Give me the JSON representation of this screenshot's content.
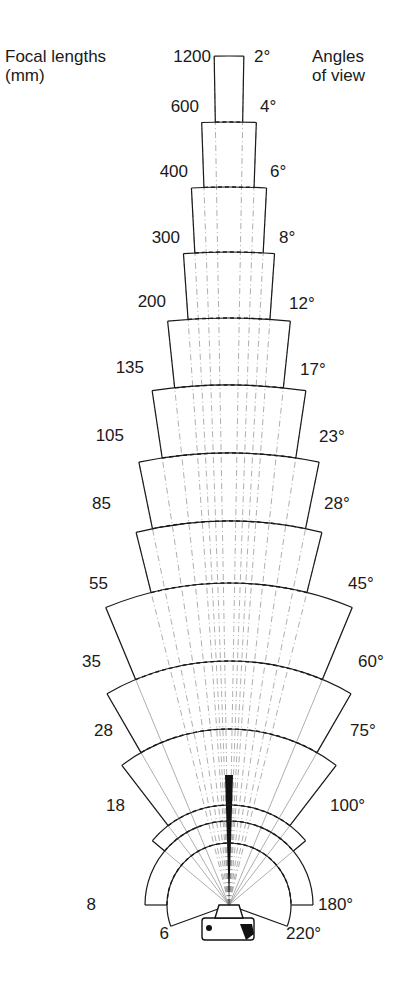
{
  "header": {
    "left_title_line1": "Focal lengths",
    "left_title_line2": "(mm)",
    "right_title_line1": "Angles",
    "right_title_line2": "of view"
  },
  "chart_data": {
    "type": "diagram",
    "left_axis_label": "Focal lengths (mm)",
    "right_axis_label": "Angles of view",
    "bands": [
      {
        "focal_mm": "1200",
        "angle": "2°",
        "angle_deg": 2,
        "top_y": 56,
        "half_w": 15
      },
      {
        "focal_mm": "600",
        "angle": "4°",
        "angle_deg": 4,
        "top_y": 122,
        "half_w": 28
      },
      {
        "focal_mm": "400",
        "angle": "6°",
        "angle_deg": 6,
        "top_y": 187,
        "half_w": 37
      },
      {
        "focal_mm": "300",
        "angle": "8°",
        "angle_deg": 8,
        "top_y": 252,
        "half_w": 46
      },
      {
        "focal_mm": "200",
        "angle": "12°",
        "angle_deg": 12,
        "top_y": 318,
        "half_w": 58
      },
      {
        "focal_mm": "135",
        "angle": "17°",
        "angle_deg": 17,
        "top_y": 385,
        "half_w": 77
      },
      {
        "focal_mm": "105",
        "angle": "23°",
        "angle_deg": 23,
        "top_y": 453,
        "half_w": 87
      },
      {
        "focal_mm": "85",
        "angle": "28°",
        "angle_deg": 28,
        "top_y": 521,
        "half_w": 91
      },
      {
        "focal_mm": "55",
        "angle": "45°",
        "angle_deg": 45,
        "top_y": 583,
        "half_w": 123
      },
      {
        "focal_mm": "35",
        "angle": "60°",
        "angle_deg": 60,
        "top_y": 661,
        "half_w": 130
      },
      {
        "focal_mm": "28",
        "angle": "75°",
        "angle_deg": 75,
        "top_y": 729,
        "half_w": 113
      },
      {
        "focal_mm": "18",
        "angle": "100°",
        "angle_deg": 100,
        "top_y": 805,
        "half_w": 97
      },
      {
        "focal_mm": "8",
        "angle": "180°",
        "angle_deg": 180,
        "top_y": 822,
        "half_w": 84
      },
      {
        "focal_mm": "6",
        "angle": "220°",
        "angle_deg": 220,
        "top_y": 845,
        "half_w": 60
      }
    ],
    "origin": {
      "x": 229,
      "y": 905
    },
    "labels": [
      {
        "focal": "1200",
        "fx": 211,
        "fy": 48,
        "angle": "2°",
        "ax": 254,
        "ay": 48
      },
      {
        "focal": "600",
        "fx": 199,
        "fy": 98,
        "angle": "4°",
        "ax": 260,
        "ay": 98
      },
      {
        "focal": "400",
        "fx": 188,
        "fy": 163,
        "angle": "6°",
        "ax": 270,
        "ay": 163
      },
      {
        "focal": "300",
        "fx": 180,
        "fy": 229,
        "angle": "8°",
        "ax": 279,
        "ay": 229
      },
      {
        "focal": "200",
        "fx": 166,
        "fy": 293,
        "angle": "12°",
        "ax": 289,
        "ay": 295
      },
      {
        "focal": "135",
        "fx": 144,
        "fy": 359,
        "angle": "17°",
        "ax": 300,
        "ay": 361
      },
      {
        "focal": "105",
        "fx": 124,
        "fy": 427,
        "angle": "23°",
        "ax": 319,
        "ay": 428
      },
      {
        "focal": "85",
        "fx": 111,
        "fy": 495,
        "angle": "28°",
        "ax": 324,
        "ay": 495
      },
      {
        "focal": "55",
        "fx": 108,
        "fy": 575,
        "angle": "45°",
        "ax": 348,
        "ay": 575
      },
      {
        "focal": "35",
        "fx": 101,
        "fy": 653,
        "angle": "60°",
        "ax": 358,
        "ay": 653
      },
      {
        "focal": "28",
        "fx": 113,
        "fy": 722,
        "angle": "75°",
        "ax": 350,
        "ay": 722
      },
      {
        "focal": "18",
        "fx": 125,
        "fy": 797,
        "angle": "100°",
        "ax": 330,
        "ay": 797
      },
      {
        "focal": "8",
        "fx": 96,
        "fy": 896,
        "angle": "180°",
        "ax": 318,
        "ay": 896
      },
      {
        "focal": "6",
        "fx": 169,
        "fy": 925,
        "angle": "220°",
        "ax": 286,
        "ay": 925
      }
    ]
  },
  "colors": {
    "line": "#1a1a1a",
    "thin": "#777777",
    "background": "#ffffff"
  }
}
